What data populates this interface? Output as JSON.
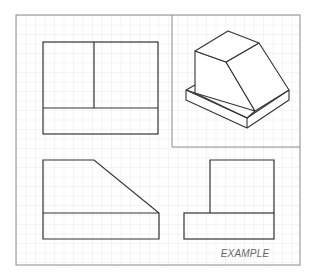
{
  "drawing": {
    "title": "Orthographic projection example",
    "caption": "EXAMPLE",
    "colors": {
      "background": "#ffffff",
      "grid": "#e4e4e4",
      "frame": "#8a8a8a",
      "line": "#333333",
      "caption": "#666666"
    },
    "views": [
      {
        "name": "top-view",
        "label": "Top view"
      },
      {
        "name": "isometric-view",
        "label": "Isometric view"
      },
      {
        "name": "front-view",
        "label": "Front view"
      },
      {
        "name": "side-view",
        "label": "Right side view"
      }
    ]
  }
}
